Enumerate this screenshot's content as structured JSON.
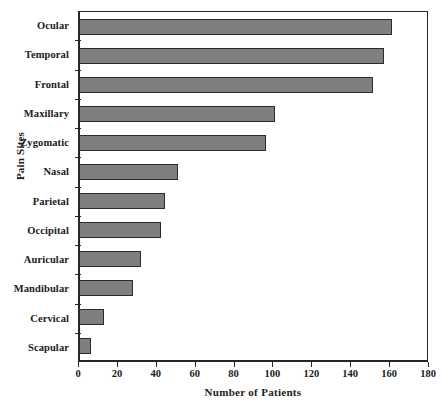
{
  "chart_data": {
    "type": "bar",
    "orientation": "horizontal",
    "title": "",
    "xlabel": "Number of Patients",
    "ylabel": "Pain Sites",
    "categories": [
      "Ocular",
      "Temporal",
      "Frontal",
      "Maxillary",
      "Zygomatic",
      "Nasal",
      "Parietal",
      "Occipital",
      "Auricular",
      "Mandibular",
      "Cervical",
      "Scapular"
    ],
    "values": [
      161,
      157,
      151,
      101,
      96,
      51,
      44,
      42,
      32,
      28,
      13,
      6
    ],
    "xlim": [
      0,
      180
    ],
    "xticks": [
      0,
      20,
      40,
      60,
      80,
      100,
      120,
      140,
      160,
      180
    ],
    "xtick_labels": [
      "0",
      "20",
      "40",
      "60",
      "80",
      "100",
      "120",
      "140",
      "160",
      "180"
    ],
    "grid": false,
    "legend": null,
    "bar_color": "#7f7f7f",
    "bar_edge_color": "#2b2b2b",
    "axis_color": "#262626",
    "background": "#ffffff"
  }
}
